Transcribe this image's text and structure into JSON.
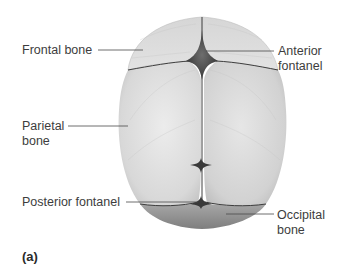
{
  "figure": {
    "panel_label": "(a)",
    "labels": {
      "frontal_bone": "Frontal bone",
      "anterior_fontanel_1": "Anterior",
      "anterior_fontanel_2": "fontanel",
      "parietal_bone_1": "Parietal",
      "parietal_bone_2": "bone",
      "posterior_fontanel": "Posterior fontanel",
      "occipital_bone_1": "Occipital",
      "occipital_bone_2": "bone"
    },
    "colors": {
      "bone_light": "#e4e4e4",
      "bone_mid": "#cfcfcf",
      "bone_shadow": "#b5b5b5",
      "suture": "#2b2b2b",
      "fontanel": "#5a5a5a",
      "occipital": "#9a9a9a",
      "leader_line": "#4a4a4a"
    }
  }
}
